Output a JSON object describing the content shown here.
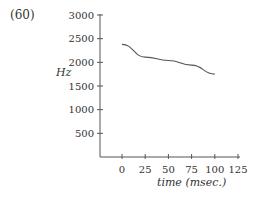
{
  "figure_label": "(60)",
  "chart_data": {
    "type": "line",
    "title": "",
    "xlabel": "time (msec.)",
    "ylabel": "Hz",
    "xlim": [
      0,
      125
    ],
    "ylim": [
      0,
      3000
    ],
    "xticks": [
      0,
      25,
      50,
      75,
      100,
      125
    ],
    "yticks": [
      500,
      1000,
      1500,
      2000,
      2500,
      3000
    ],
    "grid": false,
    "series": [
      {
        "name": "F2",
        "x": [
          0,
          25,
          50,
          75,
          100
        ],
        "y": [
          2380,
          2110,
          2040,
          1940,
          1750
        ]
      }
    ]
  }
}
